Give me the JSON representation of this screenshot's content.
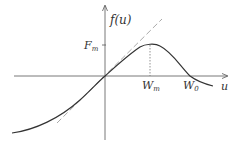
{
  "diagram": {
    "title": "",
    "y_axis_label": "f(u)",
    "x_axis_label": "u",
    "y_tick_label_main": "F",
    "y_tick_label_sub": "m",
    "x_tick_labels": [
      {
        "main": "W",
        "sub": "m"
      },
      {
        "main": "W",
        "sub": "0"
      }
    ],
    "colors": {
      "axis": "#555555",
      "curve": "#333333",
      "tangent": "#aaaaaa",
      "dotted": "#777777",
      "text": "#333333"
    },
    "elements": [
      "x-axis with arrow",
      "y-axis with arrow",
      "solid nonlinear curve f(u) through origin, peaking at (Wm, Fm), crossing zero at W0",
      "dashed linear tangent at origin",
      "dotted vertical drop line at Wm",
      "tick mark at Fm on y-axis"
    ]
  }
}
